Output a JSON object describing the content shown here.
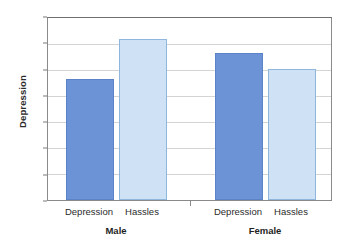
{
  "chart_data": {
    "type": "bar",
    "title": "",
    "xlabel": "",
    "ylabel": "Depression",
    "ylim": [
      0,
      14
    ],
    "yticks": [
      0,
      2,
      4,
      6,
      8,
      10,
      12,
      14
    ],
    "grid": true,
    "legend": "none",
    "groups": [
      "Male",
      "Female"
    ],
    "categories": [
      "Depression",
      "Hassles"
    ],
    "series": [
      {
        "name": "Depression",
        "color": "#6b93d6",
        "values": [
          9.3,
          11.3
        ]
      },
      {
        "name": "Hassles",
        "color": "#cfe2f5",
        "values": [
          12.4,
          10.1
        ]
      }
    ],
    "bars": [
      {
        "group": "Male",
        "category": "Depression",
        "value": 9.3,
        "color": "#6b93d6"
      },
      {
        "group": "Male",
        "category": "Hassles",
        "value": 12.4,
        "color": "#cfe2f5"
      },
      {
        "group": "Female",
        "category": "Depression",
        "value": 11.3,
        "color": "#6b93d6"
      },
      {
        "group": "Female",
        "category": "Hassles",
        "value": 10.1,
        "color": "#cfe2f5"
      }
    ]
  },
  "axis": {
    "y_title": "Depression",
    "tick_labels": [
      "14",
      "12",
      "10",
      "8",
      "6",
      "4",
      "2",
      "0"
    ]
  },
  "x_axis": {
    "bar_labels": [
      "Depression",
      "Hassles",
      "Depression",
      "Hassles"
    ],
    "group_labels": [
      "Male",
      "Female"
    ]
  },
  "colors": {
    "depression_bar": "#6b93d6",
    "hassles_bar": "#cfe2f5",
    "gridline": "#d4d4d4",
    "frame": "#8a8a8a",
    "text": "#2b2b2b",
    "background": "#ffffff"
  }
}
